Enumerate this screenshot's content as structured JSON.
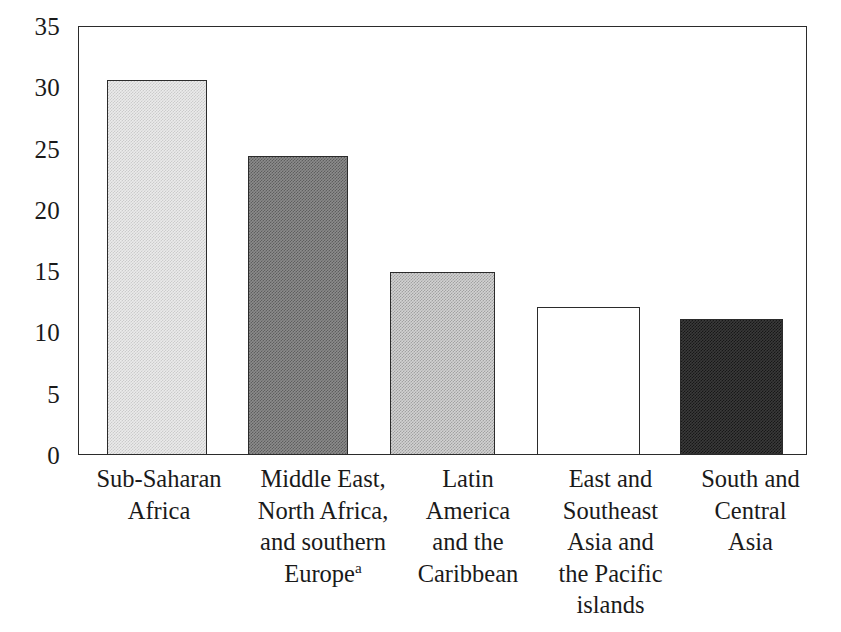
{
  "chart_data": {
    "type": "bar",
    "title": "",
    "subtitle": "",
    "xlabel": "",
    "ylabel": "",
    "ylim": [
      0,
      35
    ],
    "yticks": [
      0,
      5,
      10,
      15,
      20,
      25,
      30,
      35
    ],
    "ytick_labels": [
      "0",
      "5",
      "10",
      "15",
      "20",
      "25",
      "30",
      "35"
    ],
    "grid": false,
    "legend": "none",
    "categories": [
      "Sub-Saharan Africa",
      "Middle East, North Africa, and southern Europe",
      "Latin America and the Caribbean",
      "East and Southeast Asia and the Pacific islands",
      "South and Central Asia"
    ],
    "values": [
      30.6,
      24.4,
      14.9,
      12.1,
      11.1
    ],
    "bar_fills": [
      "lightest",
      "medium",
      "light",
      "white",
      "dark"
    ]
  },
  "axis": {
    "y_tick_labels": [
      "35",
      "30",
      "25",
      "20",
      "15",
      "10",
      "5",
      "0"
    ]
  },
  "categories": [
    {
      "lines": [
        "Sub-Saharan",
        "Africa"
      ],
      "footnote_marker": ""
    },
    {
      "lines": [
        "Middle East,",
        "North Africa,",
        "and southern",
        "Europe"
      ],
      "footnote_marker": "a"
    },
    {
      "lines": [
        "Latin",
        "America",
        "and the",
        "Caribbean"
      ],
      "footnote_marker": ""
    },
    {
      "lines": [
        "East and",
        "Southeast",
        "Asia and",
        "the Pacific",
        "islands"
      ],
      "footnote_marker": ""
    },
    {
      "lines": [
        "South and",
        "Central",
        "Asia"
      ],
      "footnote_marker": ""
    }
  ],
  "colors": {
    "axis": "#2b2b2b",
    "text": "#1a1a1a",
    "background": "#ffffff",
    "bar_lightest": "#ebebeb",
    "bar_light": "#d2d2d2",
    "bar_medium": "#8c8c8c",
    "bar_white": "#ffffff",
    "bar_dark": "#3a3a3a"
  }
}
